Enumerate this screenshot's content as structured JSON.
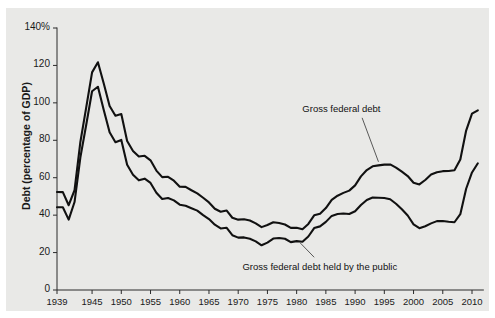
{
  "chart_data": {
    "type": "line",
    "title": "",
    "subtitle": "",
    "xlabel": "",
    "ylabel": "Debt (percentage of GDP)",
    "xlim": [
      1939,
      2011
    ],
    "ylim": [
      0,
      140
    ],
    "grid": false,
    "legend_position": "inline-annotations",
    "ytick_labels": [
      "0",
      "20",
      "40",
      "60",
      "80",
      "100",
      "120",
      "140%"
    ],
    "ytick_values": [
      0,
      20,
      40,
      60,
      80,
      100,
      120,
      140
    ],
    "xtick_labels": [
      "1939",
      "1945",
      "1950",
      "1955",
      "1960",
      "1965",
      "1970",
      "1975",
      "1980",
      "1985",
      "1990",
      "1995",
      "2000",
      "2005",
      "2010"
    ],
    "xtick_values": [
      1939,
      1945,
      1950,
      1955,
      1960,
      1965,
      1970,
      1975,
      1980,
      1985,
      1990,
      1995,
      2000,
      2005,
      2010
    ],
    "line_color": "#111111",
    "background_color": "#e9e9e7",
    "x": [
      1939,
      1940,
      1941,
      1942,
      1943,
      1944,
      1945,
      1946,
      1947,
      1948,
      1949,
      1950,
      1951,
      1952,
      1953,
      1954,
      1955,
      1956,
      1957,
      1958,
      1959,
      1960,
      1961,
      1962,
      1963,
      1964,
      1965,
      1966,
      1967,
      1968,
      1969,
      1970,
      1971,
      1972,
      1973,
      1974,
      1975,
      1976,
      1977,
      1978,
      1979,
      1980,
      1981,
      1982,
      1983,
      1984,
      1985,
      1986,
      1987,
      1988,
      1989,
      1990,
      1991,
      1992,
      1993,
      1994,
      1995,
      1996,
      1997,
      1998,
      1999,
      2000,
      2001,
      2002,
      2003,
      2004,
      2005,
      2006,
      2007,
      2008,
      2009,
      2010,
      2011
    ],
    "series": [
      {
        "name": "Gross federal debt",
        "values": [
          52.4,
          52.3,
          45.3,
          53.3,
          79.1,
          97.6,
          116.3,
          121.7,
          110.3,
          98.3,
          93.1,
          94.0,
          79.6,
          74.3,
          71.3,
          71.7,
          69.3,
          63.8,
          60.3,
          60.5,
          58.4,
          55.2,
          55.1,
          53.3,
          51.6,
          49.3,
          46.8,
          43.4,
          41.8,
          42.5,
          38.6,
          37.6,
          37.8,
          37.1,
          35.6,
          33.6,
          34.7,
          36.2,
          35.8,
          35.0,
          33.2,
          33.3,
          32.5,
          35.3,
          39.9,
          40.7,
          43.8,
          48.2,
          50.4,
          51.9,
          53.1,
          55.9,
          60.7,
          64.1,
          66.1,
          66.6,
          67.0,
          67.1,
          65.4,
          63.2,
          60.9,
          57.3,
          56.4,
          58.8,
          61.7,
          62.9,
          63.5,
          63.6,
          64.0,
          69.7,
          85.2,
          94.2,
          96.0
        ]
      },
      {
        "name": "Gross federal debt held by the public",
        "values": [
          44.2,
          44.2,
          37.6,
          47.0,
          70.9,
          88.3,
          106.2,
          108.6,
          96.2,
          84.3,
          79.0,
          80.2,
          66.9,
          61.6,
          58.6,
          59.5,
          57.2,
          52.0,
          48.6,
          49.2,
          47.9,
          45.6,
          45.0,
          43.7,
          42.4,
          40.0,
          37.9,
          34.9,
          32.9,
          33.3,
          29.3,
          28.0,
          28.1,
          27.4,
          26.0,
          23.9,
          25.3,
          27.5,
          27.8,
          27.4,
          25.6,
          26.1,
          25.8,
          28.6,
          33.1,
          34.0,
          36.4,
          39.6,
          40.6,
          40.9,
          40.6,
          42.1,
          45.4,
          48.1,
          49.4,
          49.3,
          49.2,
          48.5,
          46.1,
          43.1,
          39.8,
          35.1,
          33.0,
          34.1,
          35.6,
          36.8,
          36.9,
          36.5,
          36.2,
          40.5,
          54.1,
          62.8,
          67.7
        ]
      }
    ],
    "annotations": [
      {
        "text": "Gross federal debt",
        "x": 1988.5,
        "y": 96
      },
      {
        "text": "Gross federal debt held by the public",
        "x": 1981.5,
        "y": 12
      }
    ]
  }
}
